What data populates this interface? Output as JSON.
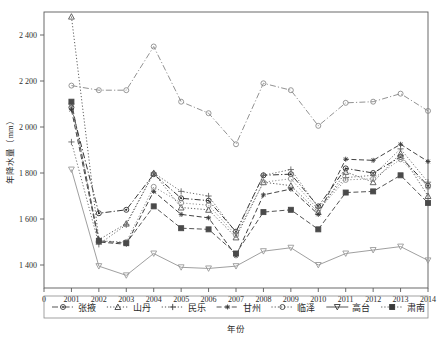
{
  "chart_data": {
    "type": "line",
    "title": "",
    "xlabel": "年份",
    "ylabel": "年降水量（mm）",
    "x": [
      2001,
      2002,
      2003,
      2004,
      2005,
      2006,
      2007,
      2008,
      2009,
      2010,
      2011,
      2012,
      2013,
      2014
    ],
    "xtick_labels": [
      "0",
      "2001",
      "2002",
      "2003",
      "2004",
      "2005",
      "2006",
      "2007",
      "2008",
      "2009",
      "2010",
      "2011",
      "2012",
      "2013",
      "2014"
    ],
    "ytick_labels": [
      "1 400",
      "1 600",
      "1 800",
      "2 000",
      "2 200",
      "2 400"
    ],
    "ytick_values": [
      1400,
      1600,
      1800,
      2000,
      2200,
      2400
    ],
    "ylim": [
      1300,
      2500
    ],
    "xlim_index": [
      -1,
      14
    ],
    "grid": false,
    "legend_position": "bottom",
    "series": [
      {
        "name": "张掖",
        "marker": "circle-dot",
        "dash": "dashdot",
        "color": "#2b2b2b",
        "values": [
          2085,
          1625,
          1640,
          1795,
          1690,
          1680,
          1545,
          1790,
          1795,
          1655,
          1820,
          1800,
          1870,
          1745
        ]
      },
      {
        "name": "山丹",
        "marker": "triangle-up",
        "dash": "dotted",
        "color": "#555555",
        "values": [
          2480,
          1510,
          1580,
          1800,
          1650,
          1640,
          1520,
          1760,
          1745,
          1630,
          1805,
          1760,
          1885,
          1700
        ]
      },
      {
        "name": "民乐",
        "marker": "plus",
        "dash": "dotted",
        "color": "#666666",
        "values": [
          1935,
          1490,
          1575,
          1800,
          1720,
          1700,
          1540,
          1790,
          1815,
          1650,
          1780,
          1790,
          1905,
          1760
        ]
      },
      {
        "name": "甘州",
        "marker": "star",
        "dash": "dashed",
        "color": "#3a3a3a",
        "values": [
          2075,
          1500,
          1490,
          1720,
          1620,
          1605,
          1440,
          1705,
          1730,
          1620,
          1860,
          1855,
          1925,
          1850
        ]
      },
      {
        "name": "临泽",
        "marker": "circle",
        "dash": "dotted",
        "color": "#8c8c8c",
        "values": [
          2100,
          1505,
          1500,
          1740,
          1670,
          1660,
          1530,
          1760,
          1775,
          1640,
          1770,
          1775,
          1860,
          1740
        ]
      },
      {
        "name": "高台",
        "marker": "triangle-down",
        "dash": "solid",
        "color": "#9a9a9a",
        "values": [
          1815,
          1395,
          1355,
          1450,
          1390,
          1385,
          1395,
          1460,
          1475,
          1400,
          1450,
          1465,
          1480,
          1420
        ]
      },
      {
        "name": "肃南",
        "marker": "square",
        "dash": "dashed",
        "color": "#4a4a4a",
        "values": [
          2110,
          1505,
          1495,
          1655,
          1560,
          1555,
          1450,
          1630,
          1640,
          1555,
          1715,
          1720,
          1790,
          1670
        ]
      },
      {
        "name": "肃南-high",
        "hidden_from_legend": true,
        "marker": "circle",
        "dash": "dashdot",
        "color": "#8c8c8c",
        "values": [
          2180,
          2160,
          2160,
          2350,
          2110,
          2060,
          1925,
          2190,
          2160,
          2005,
          2105,
          2110,
          2145,
          2070
        ]
      }
    ],
    "legend_entries": [
      {
        "label": "张掖",
        "marker": "circle-dot",
        "dash": "dashdot"
      },
      {
        "label": "山丹",
        "marker": "triangle-up",
        "dash": "dotted"
      },
      {
        "label": "民乐",
        "marker": "plus",
        "dash": "dotted"
      },
      {
        "label": "甘州",
        "marker": "star",
        "dash": "dashed"
      },
      {
        "label": "临泽",
        "marker": "circle",
        "dash": "dotted"
      },
      {
        "label": "高台",
        "marker": "triangle-down",
        "dash": "solid"
      },
      {
        "label": "肃南",
        "marker": "square",
        "dash": "dotted"
      }
    ]
  }
}
